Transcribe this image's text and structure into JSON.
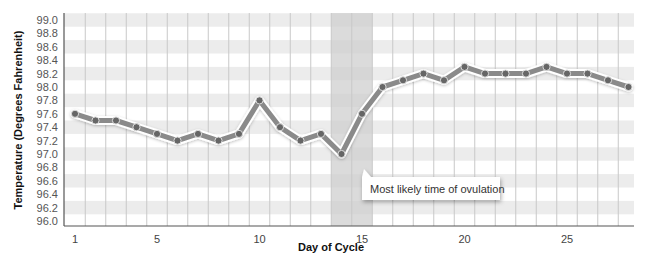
{
  "chart_data": {
    "type": "line",
    "title": "",
    "xlabel": "Day of Cycle",
    "ylabel": "Temperature (Degrees Fahrenheit)",
    "x": [
      1,
      2,
      3,
      4,
      5,
      6,
      7,
      8,
      9,
      10,
      11,
      12,
      13,
      14,
      15,
      16,
      17,
      18,
      19,
      20,
      21,
      22,
      23,
      24,
      25,
      26,
      27,
      28
    ],
    "series": [
      {
        "name": "Basal body temperature",
        "values": [
          97.6,
          97.5,
          97.5,
          97.4,
          97.3,
          97.2,
          97.3,
          97.2,
          97.3,
          97.8,
          97.4,
          97.2,
          97.3,
          97.0,
          97.6,
          98.0,
          98.1,
          98.2,
          98.1,
          98.3,
          98.2,
          98.2,
          98.2,
          98.3,
          98.2,
          98.2,
          98.1,
          98.0
        ]
      }
    ],
    "ylim": [
      96.0,
      99.0
    ],
    "xlim": [
      0.5,
      28.5
    ],
    "y_ticks": [
      "99.0",
      "98.8",
      "98.6",
      "98.4",
      "98.2",
      "98.0",
      "97.8",
      "97.6",
      "97.4",
      "97.2",
      "97.0",
      "96.8",
      "96.6",
      "96.4",
      "96.2",
      "96.0"
    ],
    "x_ticks": [
      "1",
      "5",
      "10",
      "15",
      "20",
      "25"
    ],
    "x_tick_values": [
      1,
      5,
      10,
      15,
      20,
      25
    ],
    "grid": true,
    "legend": null,
    "highlight_region": {
      "x_start": 13.5,
      "x_end": 15.5,
      "label": "Most likely time of ovulation"
    },
    "annotations": [
      {
        "text": "Most likely time of ovulation",
        "x": 15,
        "y": 96.6
      }
    ]
  },
  "colors": {
    "band": "#ececec",
    "grid": "#c8c8c8",
    "axis": "#555555",
    "highlight": "#cfcfcf",
    "line_outer": "#ffffff",
    "line_inner": "#8a8a8a",
    "marker": "#666666"
  }
}
